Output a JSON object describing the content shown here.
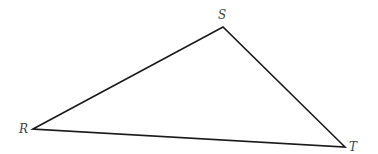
{
  "diagram": {
    "type": "triangle",
    "stroke_color": "#1a1a1a",
    "stroke_width": 1.6,
    "vertices": [
      {
        "name": "R",
        "x": 33,
        "y": 129,
        "label_x": 19,
        "label_y": 133
      },
      {
        "name": "S",
        "x": 223,
        "y": 27,
        "label_x": 218,
        "label_y": 19
      },
      {
        "name": "T",
        "x": 345,
        "y": 147,
        "label_x": 349,
        "label_y": 151
      }
    ],
    "edges": [
      {
        "from": "R",
        "to": "S"
      },
      {
        "from": "S",
        "to": "T"
      },
      {
        "from": "T",
        "to": "R"
      }
    ],
    "labels": {
      "R": "R",
      "S": "S",
      "T": "T"
    }
  }
}
